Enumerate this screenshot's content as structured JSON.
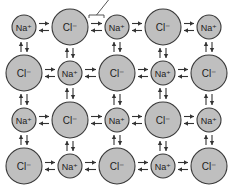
{
  "diagram": {
    "colors": {
      "ion_fill": "#bfbfbf",
      "ion_stroke": "#3a3a3a",
      "arrow": "#333333",
      "background": "#ffffff"
    },
    "ions": {
      "na": {
        "label": "Na⁺",
        "radius": 12
      },
      "cl": {
        "label": "Cl⁻",
        "radius": 18
      }
    },
    "grid": {
      "columns_x": [
        24,
        70,
        117,
        163,
        209
      ],
      "rows_y": [
        27,
        73,
        120,
        166
      ],
      "layout": [
        [
          "na",
          "cl",
          "na",
          "cl",
          "na"
        ],
        [
          "cl",
          "na",
          "cl",
          "na",
          "cl"
        ],
        [
          "na",
          "cl",
          "na",
          "cl",
          "na"
        ],
        [
          "cl",
          "na",
          "cl",
          "na",
          "cl"
        ]
      ]
    },
    "horizontal_arrows": {
      "top": "right",
      "bottom": "left"
    },
    "vertical_arrows": {
      "left": "up",
      "right": "down"
    },
    "highlight_bracket": {
      "row": 0,
      "between_cols": [
        1,
        2
      ],
      "pointer": true
    }
  }
}
